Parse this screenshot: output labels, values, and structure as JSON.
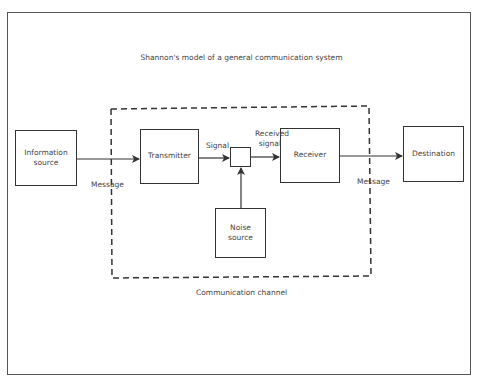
{
  "diagram": {
    "title": "Shannon's model of a general communication system",
    "nodes": {
      "information_source": "Information source",
      "transmitter": "Transmitter",
      "receiver": "Receiver",
      "destination": "Destination",
      "noise_source": "Noise source"
    },
    "edge_labels": {
      "message_in": "Message",
      "signal": "Signal",
      "received_signal": "Received signal",
      "message_out": "Message"
    },
    "channel_label": "Communication channel"
  }
}
